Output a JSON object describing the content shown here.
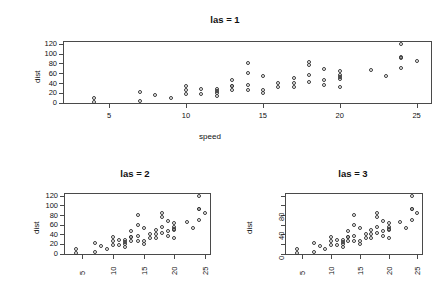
{
  "figure": {
    "background_color": "#ffffff",
    "point_color": "#3a3a3a",
    "axis_color": "#4a4a4a",
    "text_color": "#111111"
  },
  "chart_data": [
    {
      "type": "scatter",
      "title": "las = 1",
      "xlabel": "speed",
      "ylabel": "dist",
      "xlim": [
        2,
        26
      ],
      "ylim": [
        -3,
        126
      ],
      "xticks": [
        5,
        10,
        15,
        20,
        25
      ],
      "yticks": [
        0,
        20,
        40,
        60,
        80,
        100,
        120
      ],
      "xtick_labels": [
        "5",
        "10",
        "15",
        "20",
        "25"
      ],
      "ytick_labels": [
        "0",
        "20",
        "40",
        "60",
        "80",
        "100",
        "120"
      ],
      "xtick_orientation": "horizontal",
      "ytick_orientation": "horizontal",
      "ylabel_orientation": "rotated",
      "grid": false,
      "legend": null,
      "point_symbol": "open-circle",
      "x": [
        4,
        4,
        7,
        7,
        8,
        9,
        10,
        10,
        10,
        11,
        11,
        12,
        12,
        12,
        12,
        13,
        13,
        13,
        13,
        14,
        14,
        14,
        14,
        15,
        15,
        15,
        16,
        16,
        17,
        17,
        17,
        18,
        18,
        18,
        18,
        19,
        19,
        19,
        20,
        20,
        20,
        20,
        20,
        22,
        23,
        24,
        24,
        24,
        24,
        25
      ],
      "y": [
        2,
        10,
        4,
        22,
        16,
        10,
        18,
        26,
        34,
        17,
        28,
        14,
        20,
        24,
        28,
        26,
        34,
        34,
        46,
        26,
        36,
        60,
        80,
        20,
        26,
        54,
        32,
        40,
        32,
        40,
        50,
        42,
        56,
        76,
        84,
        36,
        46,
        68,
        32,
        48,
        52,
        56,
        64,
        66,
        54,
        70,
        92,
        93,
        120,
        85
      ]
    },
    {
      "type": "scatter",
      "title": "las = 2",
      "xlabel": "",
      "ylabel": "dist",
      "xlim": [
        2,
        26
      ],
      "ylim": [
        -3,
        126
      ],
      "xticks": [
        5,
        10,
        15,
        20,
        25
      ],
      "yticks": [
        0,
        20,
        40,
        60,
        80,
        100,
        120
      ],
      "xtick_labels": [
        "5",
        "10",
        "15",
        "20",
        "25"
      ],
      "ytick_labels": [
        "0",
        "20",
        "40",
        "60",
        "80",
        "100",
        "120"
      ],
      "xtick_orientation": "perpendicular-rotated",
      "ytick_orientation": "horizontal",
      "ylabel_orientation": "rotated",
      "grid": false,
      "legend": null,
      "point_symbol": "open-circle",
      "x": [
        4,
        4,
        7,
        7,
        8,
        9,
        10,
        10,
        10,
        11,
        11,
        12,
        12,
        12,
        12,
        13,
        13,
        13,
        13,
        14,
        14,
        14,
        14,
        15,
        15,
        15,
        16,
        16,
        17,
        17,
        17,
        18,
        18,
        18,
        18,
        19,
        19,
        19,
        20,
        20,
        20,
        20,
        20,
        22,
        23,
        24,
        24,
        24,
        24,
        25
      ],
      "y": [
        2,
        10,
        4,
        22,
        16,
        10,
        18,
        26,
        34,
        17,
        28,
        14,
        20,
        24,
        28,
        26,
        34,
        34,
        46,
        26,
        36,
        60,
        80,
        20,
        26,
        54,
        32,
        40,
        32,
        40,
        50,
        42,
        56,
        76,
        84,
        36,
        46,
        68,
        32,
        48,
        52,
        56,
        64,
        66,
        54,
        70,
        92,
        93,
        120,
        85
      ]
    },
    {
      "type": "scatter",
      "title": "las = 3",
      "xlabel": "",
      "ylabel": "dist",
      "xlim": [
        2,
        26
      ],
      "ylim": [
        -3,
        126
      ],
      "xticks": [
        5,
        10,
        15,
        20,
        25
      ],
      "yticks": [
        0,
        20,
        40,
        60,
        80,
        100,
        120
      ],
      "xtick_labels": [
        "5",
        "10",
        "15",
        "20",
        "25"
      ],
      "ytick_labels": [
        "0",
        "40",
        "80"
      ],
      "ytick_labeled_values": [
        0,
        40,
        80
      ],
      "xtick_orientation": "perpendicular-rotated",
      "ytick_orientation": "perpendicular-rotated",
      "ylabel_orientation": "rotated",
      "grid": false,
      "legend": null,
      "point_symbol": "open-circle",
      "x": [
        4,
        4,
        7,
        7,
        8,
        9,
        10,
        10,
        10,
        11,
        11,
        12,
        12,
        12,
        12,
        13,
        13,
        13,
        13,
        14,
        14,
        14,
        14,
        15,
        15,
        15,
        16,
        16,
        17,
        17,
        17,
        18,
        18,
        18,
        18,
        19,
        19,
        19,
        20,
        20,
        20,
        20,
        20,
        22,
        23,
        24,
        24,
        24,
        24,
        25
      ],
      "y": [
        2,
        10,
        4,
        22,
        16,
        10,
        18,
        26,
        34,
        17,
        28,
        14,
        20,
        24,
        28,
        26,
        34,
        34,
        46,
        26,
        36,
        60,
        80,
        20,
        26,
        54,
        32,
        40,
        32,
        40,
        50,
        42,
        56,
        76,
        84,
        36,
        46,
        68,
        32,
        48,
        52,
        56,
        64,
        66,
        54,
        70,
        92,
        93,
        120,
        85
      ]
    }
  ]
}
